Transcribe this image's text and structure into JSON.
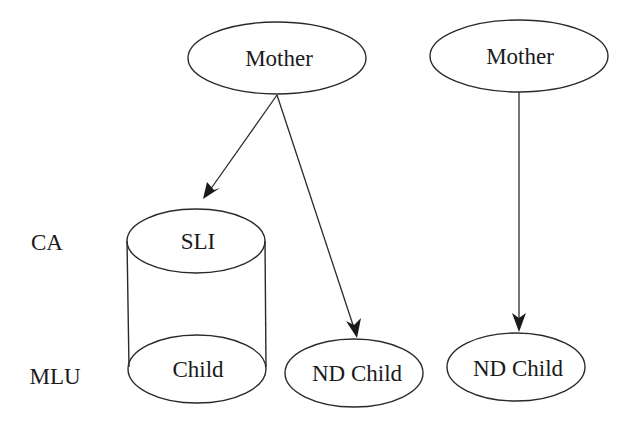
{
  "diagram": {
    "row_labels": [
      {
        "id": "ca",
        "label": "CA"
      },
      {
        "id": "mlu",
        "label": "MLU"
      }
    ],
    "nodes": [
      {
        "id": "mother-1",
        "label": "Mother",
        "shape": "ellipse"
      },
      {
        "id": "mother-2",
        "label": "Mother",
        "shape": "ellipse"
      },
      {
        "id": "sli-group",
        "label": "SLI",
        "shape": "cylinder-top"
      },
      {
        "id": "sli-child",
        "label": "Child",
        "shape": "cylinder-bottom"
      },
      {
        "id": "nd-child-1",
        "label": "ND Child",
        "shape": "ellipse"
      },
      {
        "id": "nd-child-2",
        "label": "ND Child",
        "shape": "ellipse"
      }
    ],
    "edges": [
      {
        "from": "mother-1",
        "to": "sli-group"
      },
      {
        "from": "mother-1",
        "to": "nd-child-1"
      },
      {
        "from": "mother-2",
        "to": "nd-child-2"
      }
    ],
    "colors": {
      "stroke": "#2a2a2a",
      "text": "#1a1a1a",
      "background": "#ffffff"
    }
  }
}
